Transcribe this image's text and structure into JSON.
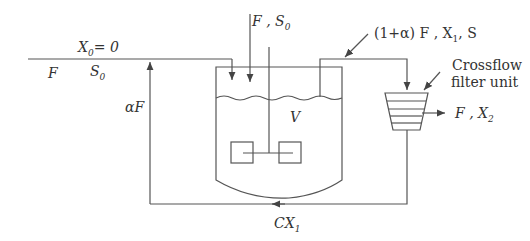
{
  "diagram": {
    "labels": {
      "feed_top": "F , S",
      "feed_top_sub": "0",
      "inlet_x": "X",
      "inlet_x_sub": "0",
      "inlet_x_eq": "= 0",
      "inlet_f": "F",
      "inlet_s": "S",
      "inlet_s_sub": "0",
      "recycle_flow": "αF",
      "reactor_volume": "V",
      "outlet_stream": "(1+α) F , X",
      "outlet_stream_sub": "1",
      "outlet_stream_s": ", S",
      "filter_title_line1": "Crossflow",
      "filter_title_line2": "filter unit",
      "permeate": "F , X",
      "permeate_sub": "2",
      "bottom_recycle": "CX",
      "bottom_recycle_sub": "1"
    },
    "colors": {
      "line": "#555555",
      "text": "#333333"
    }
  }
}
